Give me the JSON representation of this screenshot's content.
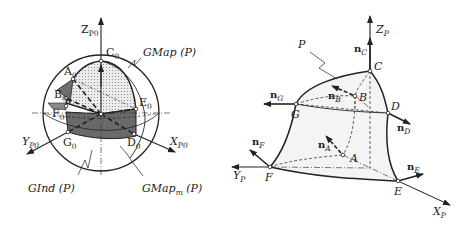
{
  "left_figure": {
    "axes": {
      "z": "Z",
      "z_sub": "P0",
      "x": "X",
      "x_sub": "P0",
      "y": "Y",
      "y_sub": "P0"
    },
    "points": [
      {
        "name": "A",
        "sub": "0"
      },
      {
        "name": "B",
        "sub": "0"
      },
      {
        "name": "C",
        "sub": "0"
      },
      {
        "name": "D",
        "sub": "0"
      },
      {
        "name": "E",
        "sub": "0"
      },
      {
        "name": "F",
        "sub": "0"
      },
      {
        "name": "G",
        "sub": "0"
      }
    ],
    "callouts": {
      "gmap": "GMap (P)",
      "gind": "GInd (P)",
      "gmapm_main": "GMap",
      "gmapm_sub": "m",
      "gmapm_tail": " (P)"
    }
  },
  "right_figure": {
    "axes": {
      "z": "Z",
      "z_sub": "P",
      "x": "X",
      "x_sub": "P",
      "y": "Y",
      "y_sub": "P"
    },
    "surface_label": "P",
    "points": [
      "A",
      "B",
      "C",
      "D",
      "E",
      "F",
      "G"
    ],
    "normals": [
      {
        "name": "n",
        "sub": "A"
      },
      {
        "name": "n",
        "sub": "B"
      },
      {
        "name": "n",
        "sub": "C"
      },
      {
        "name": "n",
        "sub": "D"
      },
      {
        "name": "n",
        "sub": "E"
      },
      {
        "name": "n",
        "sub": "F"
      },
      {
        "name": "n",
        "sub": "G"
      }
    ]
  },
  "colors": {
    "ink": "#222222",
    "shade_dark": "#6e6e6e",
    "shade_light": "#d8d8d8",
    "background": "#ffffff"
  }
}
